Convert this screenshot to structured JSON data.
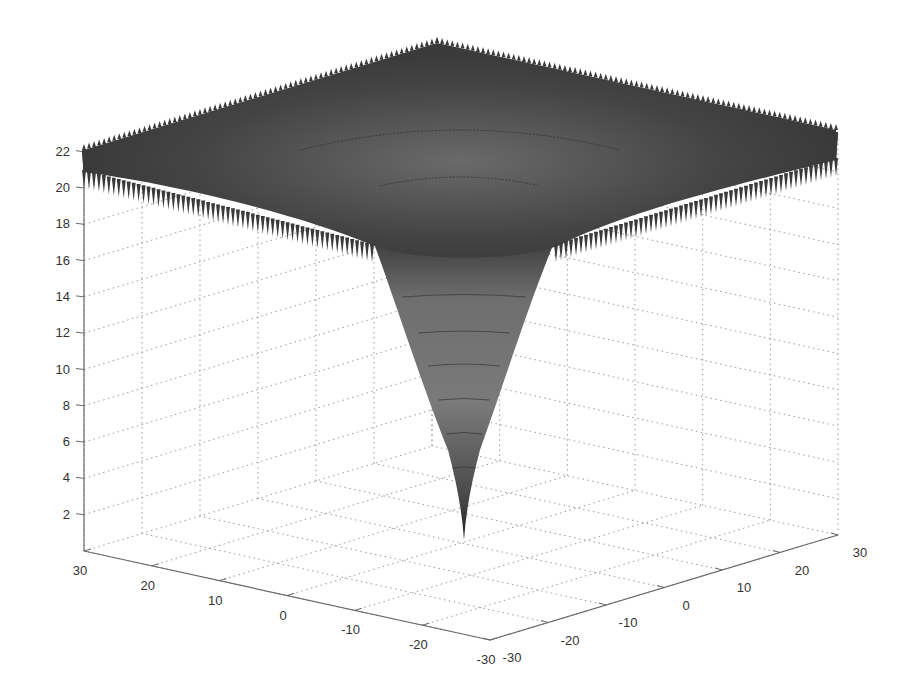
{
  "chart_data": {
    "type": "surface3d",
    "title": "",
    "xlabel": "",
    "ylabel": "",
    "zlabel": "",
    "function_shape": "Ackley-like: flat oscillating plateau near z≈20-22 with a single funnel minimum near 0 at (0,0)",
    "x": {
      "range": [
        -30,
        30
      ],
      "ticks": [
        30,
        20,
        10,
        0,
        -10,
        -20,
        -30
      ]
    },
    "y": {
      "range": [
        -30,
        30
      ],
      "ticks": [
        -30,
        -20,
        -10,
        0,
        10,
        20,
        30
      ]
    },
    "z": {
      "range": [
        0,
        22
      ],
      "ticks": [
        2,
        4,
        6,
        8,
        10,
        12,
        14,
        16,
        18,
        20,
        22
      ]
    },
    "surface_samples": {
      "r": [
        0,
        2,
        4,
        6,
        8,
        10,
        12,
        15,
        20,
        30
      ],
      "z": [
        0.0,
        6.6,
        11.5,
        15.0,
        17.4,
        18.9,
        19.8,
        20.5,
        21.0,
        21.3
      ]
    },
    "grid": true,
    "colormap": "grayscale",
    "colors": {
      "surface_dark": "#3a3a3a",
      "surface_mid": "#5c5c5c",
      "surface_light": "#8a8a8a",
      "axis": "#6a6a6a",
      "grid": "#9a9a9a",
      "text": "#333333"
    }
  },
  "axes": {
    "z_ticks": [
      "22",
      "20",
      "18",
      "16",
      "14",
      "12",
      "10",
      "8",
      "6",
      "4",
      "2"
    ],
    "x_ticks": [
      "30",
      "20",
      "10",
      "0",
      "-10",
      "-20",
      "-30"
    ],
    "y_ticks": [
      "-30",
      "-20",
      "-10",
      "0",
      "10",
      "20",
      "30"
    ]
  }
}
